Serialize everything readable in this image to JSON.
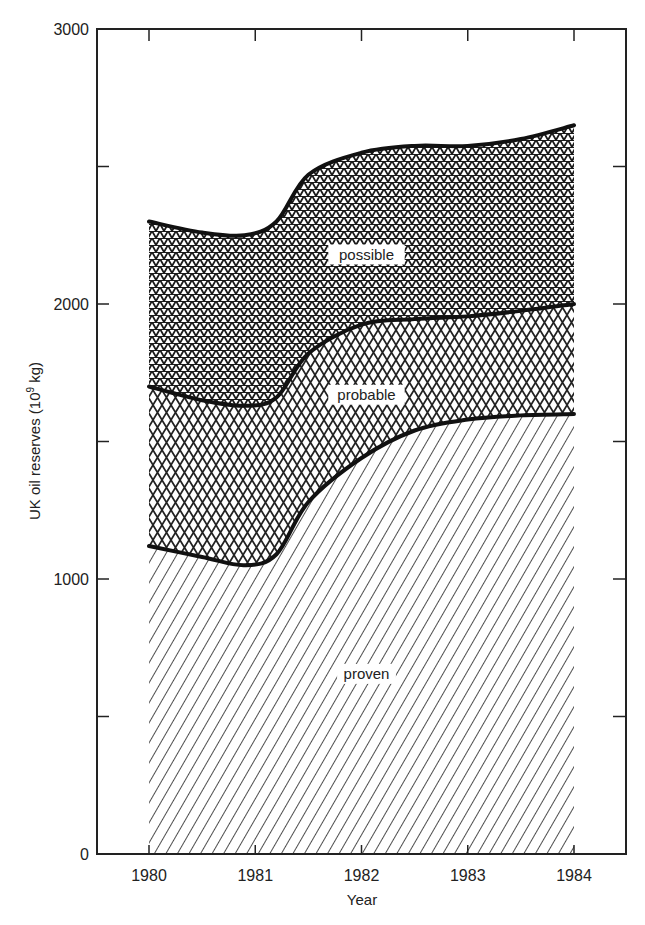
{
  "chart_data": {
    "type": "area",
    "stacked": true,
    "title": "",
    "xlabel": "Year",
    "ylabel": "UK oil reserves (10⁹ kg)",
    "ylabel_parts": {
      "main": "UK oil reserves (10",
      "sup": "9",
      "unit": " kg)"
    },
    "xlim": [
      1979.5,
      1984.5
    ],
    "ylim": [
      0,
      3000
    ],
    "x_ticks": [
      1980,
      1981,
      1982,
      1983,
      1984
    ],
    "y_ticks": [
      0,
      500,
      1000,
      1500,
      2000,
      2500,
      3000
    ],
    "y_tick_labels": [
      "0",
      "",
      "1000",
      "",
      "2000",
      "",
      "3000"
    ],
    "grid": false,
    "legend": "inline labels",
    "x": [
      1980,
      1980.5,
      1980.9,
      1981.2,
      1981.5,
      1982,
      1982.5,
      1983,
      1983.5,
      1984
    ],
    "series": [
      {
        "name": "proven",
        "pattern": "diagonal-hatch",
        "cumulative_top": [
          1120,
          1080,
          1050,
          1090,
          1280,
          1440,
          1540,
          1580,
          1595,
          1600
        ]
      },
      {
        "name": "probable",
        "pattern": "diamond-crosshatch",
        "cumulative_top": [
          1700,
          1650,
          1630,
          1660,
          1820,
          1925,
          1945,
          1955,
          1975,
          2000
        ]
      },
      {
        "name": "possible",
        "pattern": "triangle-grid",
        "cumulative_top": [
          2300,
          2260,
          2250,
          2300,
          2470,
          2550,
          2575,
          2575,
          2600,
          2650
        ]
      }
    ],
    "annotations": [
      {
        "text": "possible",
        "x": 1982,
        "y": 2180
      },
      {
        "text": "probable",
        "x": 1982,
        "y": 1670
      },
      {
        "text": "proven",
        "x": 1982,
        "y": 655
      }
    ]
  }
}
